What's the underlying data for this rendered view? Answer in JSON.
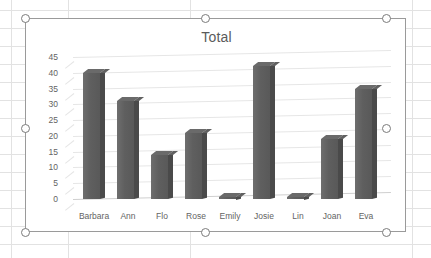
{
  "app": {
    "context": "spreadsheet-with-selected-chart",
    "chart_selected": true
  },
  "selection": {
    "handle_name": "resize-handle",
    "handles": [
      "top-left",
      "top-center",
      "top-right",
      "middle-left",
      "middle-right",
      "bottom-left",
      "bottom-center",
      "bottom-right"
    ]
  },
  "colors": {
    "bar_front": "#5f5f5f",
    "bar_side": "#4a4a4a",
    "bar_top": "#6a6a6a",
    "gridline": "#e6e6e6",
    "axis_text": "#636363",
    "title_text": "#5b5b5b",
    "chart_border": "#9a9a9a",
    "sheet_gridline": "#e2e2e2",
    "background": "#ffffff"
  },
  "chart_data": {
    "type": "bar",
    "title": "Total",
    "subtitle": "",
    "xlabel": "",
    "ylabel": "",
    "categories": [
      "Barbara",
      "Ann",
      "Flo",
      "Rose",
      "Emily",
      "Josie",
      "Lin",
      "Joan",
      "Eva"
    ],
    "values": [
      40,
      31,
      14,
      21,
      0,
      42,
      0,
      19,
      35
    ],
    "series": [
      {
        "name": "Total",
        "values": [
          40,
          31,
          14,
          21,
          0,
          42,
          0,
          19,
          35
        ]
      }
    ],
    "ylim": [
      0,
      45
    ],
    "ytick_labels": [
      "45",
      "40",
      "35",
      "30",
      "25",
      "20",
      "15",
      "10",
      "5",
      "0"
    ],
    "ytick_values": [
      45,
      40,
      35,
      30,
      25,
      20,
      15,
      10,
      5,
      0
    ],
    "ytick_step": 5,
    "grid": true,
    "grid_axis": "y",
    "legend": false,
    "legend_position": "none",
    "style": "3d-column",
    "annotations": []
  }
}
